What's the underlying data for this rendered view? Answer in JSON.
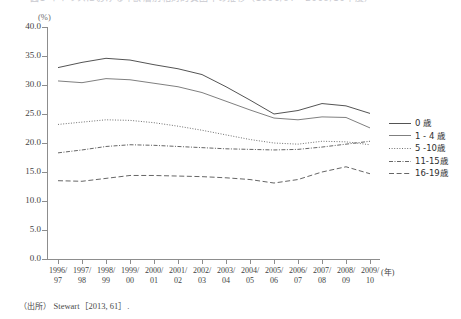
{
  "title": "図1 イギリスにおける年齢層別相対的貧困率の推移（1996/97～2009/10年度）",
  "axis": {
    "unit_label": "(%)",
    "x_unit_label": "(年)",
    "y_ticks": [
      "40.0",
      "35.0",
      "30.0",
      "25.0",
      "20.0",
      "15.0",
      "10.0",
      "5.0",
      "0.0"
    ],
    "x_labels_line1": [
      "1996/",
      "1997/",
      "1998/",
      "1999/",
      "2000/",
      "2001/",
      "2002/",
      "2003/",
      "2004/",
      "2005/",
      "2006/",
      "2007/",
      "2008/",
      "2009/"
    ],
    "x_labels_line2": [
      "97",
      "98",
      "99",
      "00",
      "01",
      "02",
      "03",
      "04",
      "05",
      "06",
      "07",
      "08",
      "09",
      "10"
    ]
  },
  "legend": {
    "items": [
      {
        "label": "0 歳",
        "style": "solid",
        "color": "#404040"
      },
      {
        "label": "1 - 4 歳",
        "style": "solid",
        "color": "#707070"
      },
      {
        "label": "5 -10歳",
        "style": "dotted",
        "color": "#565656"
      },
      {
        "label": "11-15歳",
        "style": "dashdot",
        "color": "#4a4a4a"
      },
      {
        "label": "16-19歳",
        "style": "dashed",
        "color": "#4a4a4a"
      }
    ]
  },
  "source": {
    "prefix": "（出所）",
    "text": "Stewart［2013, 61］."
  },
  "chart_data": {
    "type": "line",
    "title": "図1 イギリスにおける年齢層別相対的貧困率の推移（1996/97～2009/10年度）",
    "xlabel": "(年)",
    "ylabel": "(%)",
    "ylim": [
      0,
      40
    ],
    "ytick_step": 5,
    "grid": false,
    "legend_position": "right",
    "categories": [
      "1996/97",
      "1997/98",
      "1998/99",
      "1999/00",
      "2000/01",
      "2001/02",
      "2002/03",
      "2003/04",
      "2004/05",
      "2005/06",
      "2006/07",
      "2007/08",
      "2008/09",
      "2009/10"
    ],
    "series": [
      {
        "name": "0 歳",
        "style": "solid",
        "values": [
          33.0,
          33.9,
          34.6,
          34.3,
          33.5,
          32.8,
          31.8,
          29.7,
          27.4,
          25.0,
          25.6,
          26.8,
          26.4,
          25.1
        ]
      },
      {
        "name": "1 - 4 歳",
        "style": "solid",
        "values": [
          30.7,
          30.4,
          31.1,
          30.9,
          30.3,
          29.7,
          28.7,
          27.2,
          25.7,
          24.3,
          24.0,
          24.5,
          24.4,
          22.6
        ]
      },
      {
        "name": "5 -10歳",
        "style": "dotted",
        "values": [
          23.2,
          23.6,
          24.0,
          23.9,
          23.5,
          22.9,
          22.2,
          21.4,
          20.6,
          20.0,
          19.8,
          20.3,
          20.2,
          19.7
        ]
      },
      {
        "name": "11-15歳",
        "style": "dashdot",
        "values": [
          18.3,
          18.8,
          19.4,
          19.7,
          19.6,
          19.4,
          19.2,
          19.0,
          18.9,
          18.8,
          18.9,
          19.3,
          19.8,
          20.3
        ]
      },
      {
        "name": "16-19歳",
        "style": "dashed",
        "values": [
          13.5,
          13.4,
          13.9,
          14.4,
          14.4,
          14.3,
          14.2,
          14.0,
          13.7,
          13.1,
          13.7,
          15.0,
          15.9,
          14.7
        ]
      }
    ]
  }
}
